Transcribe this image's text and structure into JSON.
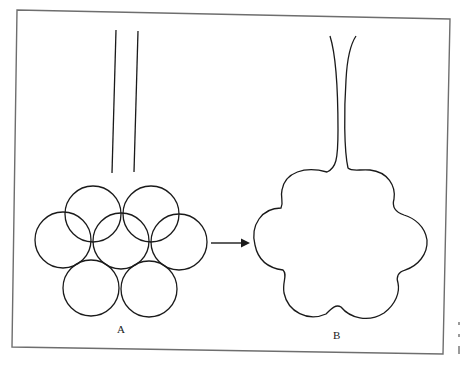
{
  "figure": {
    "panels": [
      {
        "id": "A",
        "label": "A",
        "description": "cluster of seven spherical alveoli with parallel duct"
      },
      {
        "id": "B",
        "label": "B",
        "description": "merged lobed alveolar sac with flared duct"
      }
    ],
    "arrow": {
      "direction": "right",
      "from": "A",
      "to": "B"
    },
    "colors": {
      "stroke": "#1a1a1a",
      "frame": "#6e6e6e",
      "background": "#ffffff"
    }
  }
}
